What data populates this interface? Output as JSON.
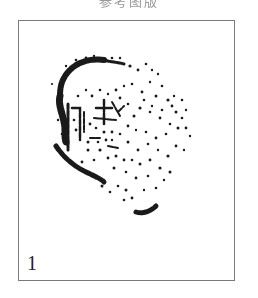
{
  "caption": {
    "text": "参考图版"
  },
  "plate": {
    "figure_number": "1",
    "frame_color": "#7a7a7a",
    "ink_color": "#1a1a1a",
    "subject": "seal-impression"
  },
  "seal": {
    "arc_strokes": [
      {
        "d": "M104 60 C90 58 78 62 70 70 C62 78 60 86 60 96",
        "w": 6
      },
      {
        "d": "M60 96 C58 104 62 112 64 122 C66 130 64 136 66 142",
        "w": 7
      },
      {
        "d": "M56 146 C64 158 74 166 86 172 C94 176 100 178 104 182",
        "w": 5
      },
      {
        "d": "M136 212 C142 214 150 212 156 206",
        "w": 5
      },
      {
        "d": "M104 60 C110 62 118 62 124 64",
        "w": 3
      }
    ],
    "glyph_strokes": [
      {
        "d": "M68 104 L68 150",
        "w": 3
      },
      {
        "d": "M72 108 L80 108 L80 140",
        "w": 2.5
      },
      {
        "d": "M84 112 L84 132",
        "w": 2
      },
      {
        "d": "M96 108 L112 108",
        "w": 2.5
      },
      {
        "d": "M104 100 L104 124",
        "w": 2.5
      },
      {
        "d": "M94 118 L116 120",
        "w": 2
      },
      {
        "d": "M112 102 L120 116",
        "w": 2
      },
      {
        "d": "M118 112 L124 106",
        "w": 2
      },
      {
        "d": "M90 138 L100 138",
        "w": 2
      },
      {
        "d": "M108 146 L118 148",
        "w": 2
      }
    ],
    "dots": [
      [
        130,
        66,
        1.6
      ],
      [
        138,
        70,
        1.4
      ],
      [
        146,
        64,
        1.3
      ],
      [
        152,
        70,
        1.2
      ],
      [
        158,
        74,
        1.2
      ],
      [
        162,
        86,
        1.3
      ],
      [
        150,
        82,
        1.2
      ],
      [
        142,
        92,
        1.4
      ],
      [
        156,
        96,
        1.5
      ],
      [
        168,
        100,
        1.6
      ],
      [
        172,
        106,
        1.4
      ],
      [
        176,
        112,
        1.5
      ],
      [
        182,
        118,
        1.3
      ],
      [
        186,
        128,
        1.4
      ],
      [
        190,
        136,
        1.2
      ],
      [
        178,
        128,
        1.5
      ],
      [
        170,
        124,
        1.3
      ],
      [
        160,
        118,
        1.4
      ],
      [
        150,
        112,
        1.3
      ],
      [
        140,
        108,
        1.6
      ],
      [
        134,
        116,
        1.5
      ],
      [
        128,
        126,
        1.4
      ],
      [
        136,
        130,
        1.2
      ],
      [
        146,
        132,
        1.3
      ],
      [
        156,
        138,
        1.4
      ],
      [
        166,
        134,
        1.3
      ],
      [
        176,
        146,
        1.4
      ],
      [
        184,
        150,
        1.2
      ],
      [
        168,
        156,
        1.6
      ],
      [
        158,
        150,
        1.2
      ],
      [
        148,
        144,
        1.3
      ],
      [
        138,
        150,
        1.4
      ],
      [
        128,
        142,
        1.5
      ],
      [
        120,
        134,
        1.3
      ],
      [
        116,
        156,
        1.5
      ],
      [
        124,
        160,
        1.4
      ],
      [
        132,
        160,
        1.3
      ],
      [
        140,
        164,
        1.5
      ],
      [
        150,
        160,
        1.4
      ],
      [
        160,
        168,
        1.6
      ],
      [
        170,
        172,
        1.5
      ],
      [
        148,
        176,
        1.3
      ],
      [
        136,
        178,
        1.4
      ],
      [
        126,
        172,
        1.3
      ],
      [
        114,
        168,
        1.5
      ],
      [
        108,
        158,
        1.4
      ],
      [
        100,
        150,
        1.6
      ],
      [
        94,
        160,
        1.3
      ],
      [
        88,
        150,
        1.5
      ],
      [
        82,
        162,
        1.4
      ],
      [
        118,
        186,
        1.3
      ],
      [
        126,
        190,
        1.5
      ],
      [
        132,
        198,
        1.4
      ],
      [
        124,
        200,
        1.3
      ],
      [
        110,
        192,
        1.3
      ],
      [
        102,
        186,
        1.5
      ],
      [
        96,
        178,
        1.6
      ],
      [
        144,
        190,
        1.2
      ],
      [
        156,
        188,
        1.3
      ],
      [
        164,
        180,
        1.2
      ],
      [
        78,
        96,
        1.3
      ],
      [
        86,
        90,
        1.2
      ],
      [
        92,
        96,
        1.4
      ],
      [
        100,
        90,
        1.3
      ],
      [
        108,
        94,
        1.2
      ],
      [
        116,
        90,
        1.4
      ],
      [
        124,
        86,
        1.2
      ],
      [
        132,
        84,
        1.3
      ],
      [
        120,
        98,
        1.4
      ],
      [
        128,
        104,
        1.3
      ],
      [
        112,
        132,
        1.4
      ],
      [
        104,
        132,
        1.5
      ],
      [
        96,
        128,
        1.3
      ],
      [
        90,
        124,
        1.4
      ],
      [
        74,
        120,
        1.3
      ],
      [
        76,
        130,
        1.4
      ],
      [
        88,
        142,
        1.5
      ],
      [
        98,
        142,
        1.3
      ],
      [
        106,
        140,
        1.4
      ],
      [
        112,
        140,
        1.2
      ],
      [
        60,
        100,
        1.3
      ],
      [
        58,
        120,
        1.2
      ],
      [
        62,
        134,
        1.3
      ],
      [
        52,
        84,
        1.1
      ],
      [
        66,
        66,
        1.2
      ],
      [
        76,
        60,
        1.3
      ],
      [
        86,
        58,
        1.4
      ],
      [
        94,
        56,
        1.2
      ],
      [
        112,
        58,
        1.3
      ],
      [
        120,
        58,
        1.2
      ],
      [
        144,
        100,
        1.3
      ],
      [
        152,
        106,
        1.2
      ],
      [
        162,
        110,
        1.3
      ],
      [
        174,
        96,
        1.2
      ],
      [
        182,
        100,
        1.3
      ],
      [
        186,
        110,
        1.2
      ]
    ]
  }
}
